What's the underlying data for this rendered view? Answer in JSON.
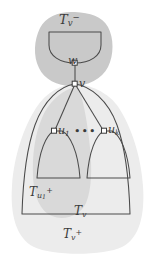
{
  "figure": {
    "width": 153,
    "height": 257,
    "background": "#ffffff",
    "colors": {
      "blob_dark": "#c9c9c9",
      "blob_mid": "#d9d9d9",
      "blob_light": "#ececec",
      "stroke": "#4a4a4a",
      "node_fill": "#ffffff",
      "text": "#3b3b3b"
    }
  },
  "labels": {
    "tv_minus": {
      "base": "T",
      "sub": "v",
      "sup": "−",
      "text": "T_v^-"
    },
    "w": {
      "text": "w"
    },
    "v": {
      "text": "v"
    },
    "u1": {
      "base": "u",
      "sub": "1",
      "text": "u_1"
    },
    "dots": {
      "text": "•••"
    },
    "uk": {
      "base": "u",
      "sub": "k",
      "text": "u_k"
    },
    "tu1_plus": {
      "base": "T",
      "sub": "u1",
      "sup": "+",
      "text": "T_u1^+"
    },
    "tv": {
      "base": "T",
      "sub": "v",
      "text": "T_v"
    },
    "tv_plus": {
      "base": "T",
      "sub": "v",
      "sup": "+",
      "text": "T_v^+"
    }
  },
  "nodes": [
    {
      "name": "w",
      "x": 75,
      "y": 63,
      "shape": "square"
    },
    {
      "name": "v",
      "x": 75,
      "y": 84,
      "shape": "square"
    },
    {
      "name": "u1",
      "x": 54,
      "y": 131,
      "shape": "square"
    },
    {
      "name": "uk",
      "x": 104,
      "y": 131,
      "shape": "square"
    }
  ],
  "edges": [
    {
      "from": "w",
      "to": "v"
    },
    {
      "from": "v",
      "to": "u1"
    },
    {
      "from": "v",
      "to": "uk"
    },
    {
      "from": "v",
      "to": "tv-left-boundary"
    },
    {
      "from": "v",
      "to": "tv-right-boundary"
    }
  ],
  "regions": [
    {
      "name": "tv-minus-blob",
      "shade": "dark",
      "label": "T_v^-"
    },
    {
      "name": "tu1-plus-blob",
      "shade": "mid",
      "label": "T_u1^+"
    },
    {
      "name": "tv-plus-blob",
      "shade": "light",
      "label": "T_v^+"
    },
    {
      "name": "tv-outline",
      "shade": "none",
      "label": "T_v"
    },
    {
      "name": "tw-subtree-outline",
      "shade": "none",
      "label": ""
    },
    {
      "name": "tu1-subtree-outline",
      "shade": "none",
      "label": ""
    },
    {
      "name": "tuk-subtree-outline",
      "shade": "none",
      "label": ""
    }
  ]
}
